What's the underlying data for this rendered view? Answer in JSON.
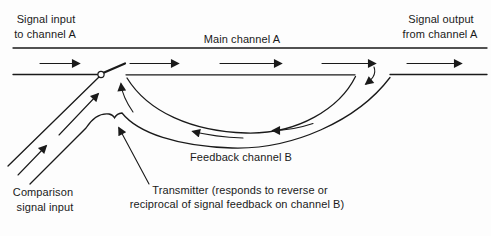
{
  "diagram": {
    "title_hint": "Feedback channel diagram",
    "labels": {
      "signal_input_line1": "Signal input",
      "signal_input_line2": "to channel A",
      "main_channel": "Main channel A",
      "signal_output_line1": "Signal output",
      "signal_output_line2": "from channel A",
      "feedback_channel": "Feedback channel B",
      "comparison_line1": "Comparison",
      "comparison_line2": "signal input",
      "transmitter_line1": "Transmitter (responds to reverse or",
      "transmitter_line2": "reciprocal of signal feedback on channel B)"
    },
    "colors": {
      "line": "#1a1a1a",
      "background": "#fdfdfd"
    },
    "flow": {
      "main_channel_direction": "left-to-right",
      "feedback_channel_direction": "right-to-left",
      "comparison_input_direction": "lower-left-to-junction"
    }
  }
}
